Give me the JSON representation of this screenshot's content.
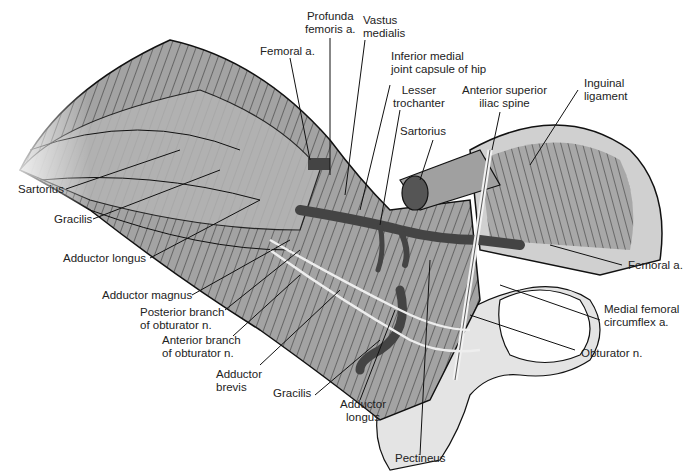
{
  "figure": {
    "type": "anatomical-illustration",
    "colors": {
      "muscle": "#9a9a9a",
      "muscle_light": "#c4c4c4",
      "line": "#1a1a1a",
      "vessel": "#4a4a4a",
      "bone": "#e6e6e6",
      "background": "#ffffff"
    }
  },
  "labels": {
    "femoral_a_top": "Femoral a.",
    "profunda_femoris": "Profunda\nfemoris a.",
    "vastus_medialis": "Vastus\nmedialis",
    "inferior_medial_capsule": "Inferior medial\njoint capsule of hip",
    "lesser_trochanter": "Lesser\ntrochanter",
    "anterior_superior_iliac_spine": "Anterior superior\niliac spine",
    "inguinal_ligament": "Inguinal\nligament",
    "sartorius_right": "Sartorius",
    "sartorius_left": "Sartorius",
    "gracilis_left": "Gracilis",
    "adductor_longus_left": "Adductor longus",
    "adductor_magnus": "Adductor magnus",
    "posterior_branch": "Posterior branch\nof obturator n.",
    "anterior_branch": "Anterior branch\nof obturator n.",
    "adductor_brevis": "Adductor\nbrevis",
    "gracilis_bottom": "Gracilis",
    "adductor_longus_bottom": "Adductor\nlongus",
    "pectineus": "Pectineus",
    "femoral_a_right": "Femoral a.",
    "medial_femoral_circumflex": "Medial femoral\ncircumflex a.",
    "obturator_n": "Obturator n."
  }
}
